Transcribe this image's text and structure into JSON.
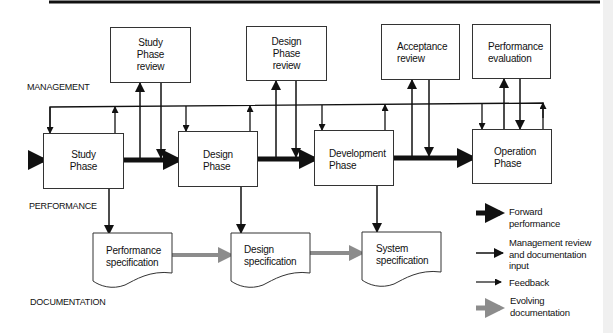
{
  "sections": {
    "management": "MANAGEMENT",
    "performance": "PERFORMANCE",
    "documentation": "DOCUMENTATION"
  },
  "review_boxes": [
    {
      "label": "Study\nPhase\nreview"
    },
    {
      "label": "Design\nPhase\nreview"
    },
    {
      "label": "Acceptance\nreview"
    },
    {
      "label": "Performance\nevaluation"
    }
  ],
  "phase_boxes": [
    {
      "label": "Study\nPhase"
    },
    {
      "label": "Design\nPhase"
    },
    {
      "label": "Development\nPhase"
    },
    {
      "label": "Operation\nPhase"
    }
  ],
  "documents": [
    {
      "label": "Performance\nspecification"
    },
    {
      "label": "Design\nspecification"
    },
    {
      "label": "System\nspecification"
    }
  ],
  "legend": [
    {
      "label": "Forward\nperformance",
      "style": "thick-black-arrow"
    },
    {
      "label": "Management review\nand documentation\ninput",
      "style": "medium-black-arrow"
    },
    {
      "label": "Feedback",
      "style": "thin-black-arrow"
    },
    {
      "label": "Evolving\ndocumentation",
      "style": "thick-gray-arrow"
    }
  ],
  "colors": {
    "line": "#111111",
    "evolving": "#8c8c8c",
    "box_border": "#333333"
  }
}
